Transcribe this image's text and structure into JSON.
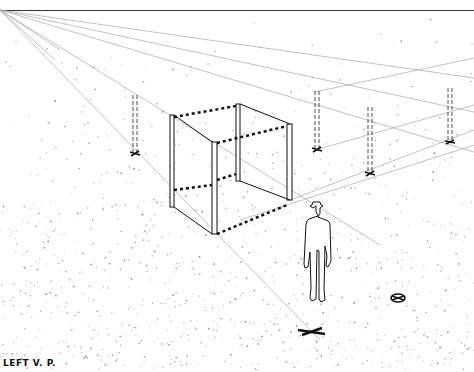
{
  "labels": {
    "left_vp": "LEFT V. P."
  },
  "colors": {
    "ink": "#111111",
    "guide": "#9a9a9a",
    "paper": "#ffffff",
    "stipple": "#777777"
  },
  "elements": {
    "horizon_line": {
      "y": 10
    },
    "vanishing_point": {
      "x": 0,
      "y": 30
    },
    "cube": "wire-frame cube with dashed connecting rails",
    "posts": 4,
    "figure": "standing man with hat",
    "marker": "circular target on ground"
  }
}
